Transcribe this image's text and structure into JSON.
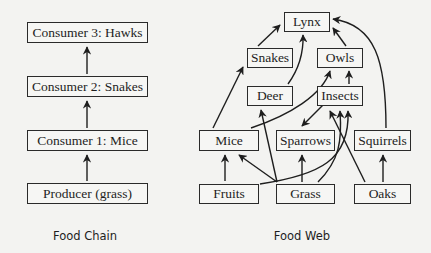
{
  "food_chain": {
    "caption": "Food Chain",
    "levels": [
      {
        "id": "hawks",
        "label": "Consumer 3: Hawks"
      },
      {
        "id": "snakes",
        "label": "Consumer 2: Snakes"
      },
      {
        "id": "mice",
        "label": "Consumer 1: Mice"
      },
      {
        "id": "grass",
        "label": "Producer (grass)"
      }
    ],
    "arrows": [
      {
        "from": "grass",
        "to": "mice"
      },
      {
        "from": "mice",
        "to": "snakes"
      },
      {
        "from": "snakes",
        "to": "hawks"
      }
    ]
  },
  "food_web": {
    "caption": "Food Web",
    "nodes": {
      "lynx": "Lynx",
      "snakes": "Snakes",
      "owls": "Owls",
      "deer": "Deer",
      "insects": "Insects",
      "mice": "Mice",
      "sparrows": "Sparrows",
      "squirrels": "Squirrels",
      "fruits": "Fruits",
      "grass": "Grass",
      "oaks": "Oaks"
    },
    "arrows": [
      {
        "from": "snakes",
        "to": "lynx"
      },
      {
        "from": "deer",
        "to": "lynx"
      },
      {
        "from": "owls",
        "to": "lynx"
      },
      {
        "from": "squirrels",
        "to": "lynx"
      },
      {
        "from": "mice",
        "to": "snakes"
      },
      {
        "from": "mice",
        "to": "owls"
      },
      {
        "from": "insects",
        "to": "owls"
      },
      {
        "from": "insects",
        "to": "sparrows"
      },
      {
        "from": "grass",
        "to": "deer"
      },
      {
        "from": "fruits",
        "to": "mice"
      },
      {
        "from": "grass",
        "to": "mice"
      },
      {
        "from": "grass",
        "to": "sparrows"
      },
      {
        "from": "fruits",
        "to": "insects"
      },
      {
        "from": "grass",
        "to": "insects"
      },
      {
        "from": "oaks",
        "to": "insects"
      },
      {
        "from": "oaks",
        "to": "squirrels"
      }
    ]
  }
}
